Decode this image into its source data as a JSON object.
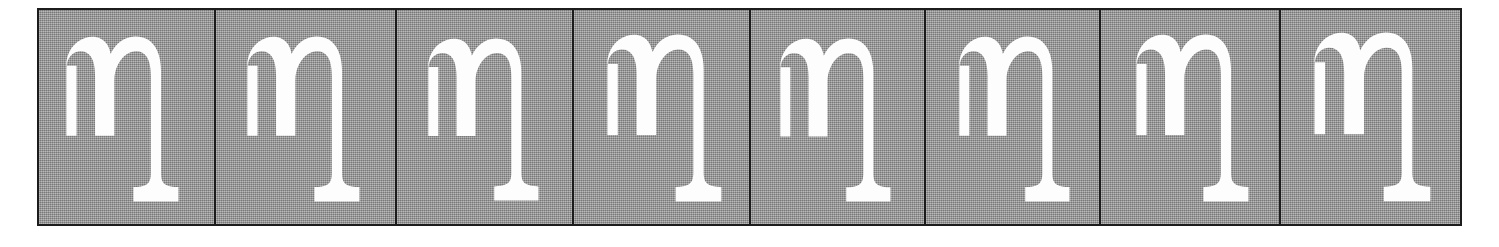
{
  "figure": {
    "kind": "character-sample-strip",
    "orientation": "horizontal",
    "sample_count": 8,
    "background_color": "#9d9d9d",
    "ink_color": "#fdfdfd",
    "border_color": "#1c1c1c",
    "page_color": "#ffffff",
    "glyph_character": "η",
    "glyph_name": "greek-small-letter-eta",
    "glyph_style": "serif"
  },
  "strip": {
    "name": "eta-sample-strip",
    "tiles": [
      {
        "index": 1,
        "name": "eta-sample-1",
        "character": "η",
        "width": 177,
        "glyph_left": 24,
        "glyph_top": 26,
        "glyph_width": 118,
        "glyph_height": 168
      },
      {
        "index": 2,
        "name": "eta-sample-2",
        "character": "η",
        "width": 181,
        "glyph_left": 28,
        "glyph_top": 26,
        "glyph_width": 118,
        "glyph_height": 168
      },
      {
        "index": 3,
        "name": "eta-sample-3",
        "character": "η",
        "width": 177,
        "glyph_left": 28,
        "glyph_top": 28,
        "glyph_width": 116,
        "glyph_height": 165
      },
      {
        "index": 4,
        "name": "eta-sample-4",
        "character": "η",
        "width": 177,
        "glyph_left": 30,
        "glyph_top": 24,
        "glyph_width": 120,
        "glyph_height": 170
      },
      {
        "index": 5,
        "name": "eta-sample-5",
        "character": "η",
        "width": 175,
        "glyph_left": 26,
        "glyph_top": 28,
        "glyph_width": 116,
        "glyph_height": 166
      },
      {
        "index": 6,
        "name": "eta-sample-6",
        "character": "η",
        "width": 175,
        "glyph_left": 30,
        "glyph_top": 26,
        "glyph_width": 116,
        "glyph_height": 168
      },
      {
        "index": 7,
        "name": "eta-sample-7",
        "character": "η",
        "width": 180,
        "glyph_left": 32,
        "glyph_top": 24,
        "glyph_width": 118,
        "glyph_height": 170
      },
      {
        "index": 8,
        "name": "eta-sample-8",
        "character": "η",
        "width": 179,
        "glyph_left": 30,
        "glyph_top": 22,
        "glyph_width": 122,
        "glyph_height": 172
      }
    ]
  }
}
